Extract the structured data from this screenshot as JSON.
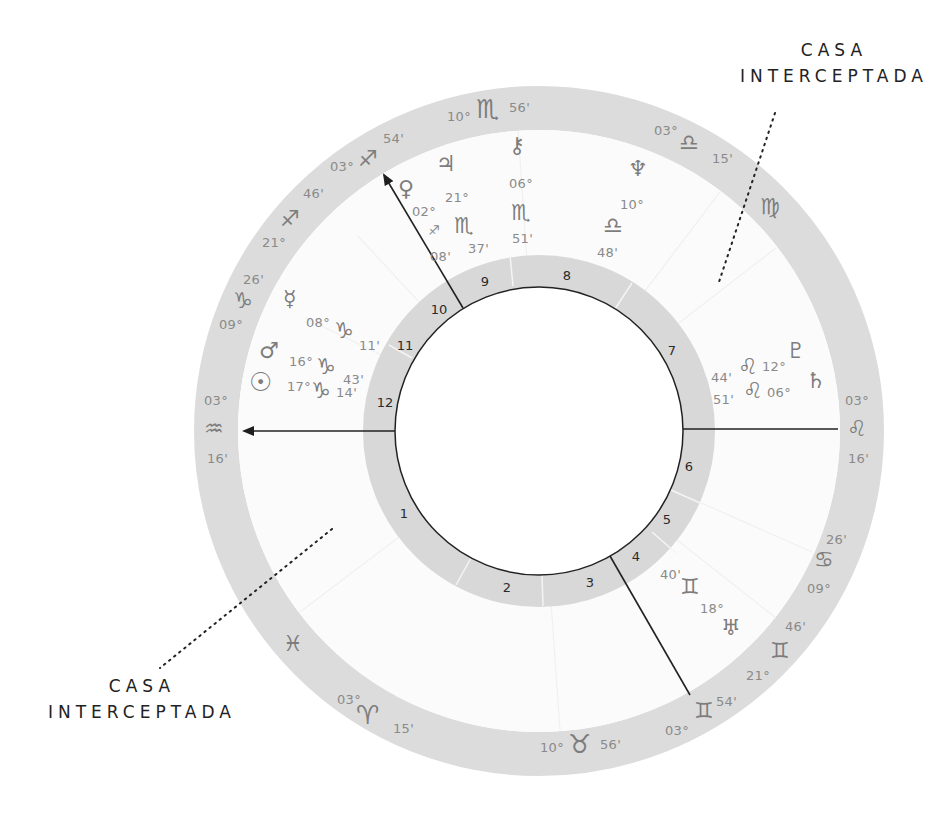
{
  "annotations": {
    "top_right": {
      "line1": "CASA",
      "line2": "INTERCEPTADA"
    },
    "bottom_left": {
      "line1": "CASA",
      "line2": "INTERCEPTADA"
    }
  },
  "houses": [
    "1",
    "2",
    "3",
    "4",
    "5",
    "6",
    "7",
    "8",
    "9",
    "10",
    "11",
    "12"
  ],
  "cusps": {
    "asc": {
      "deg": "03°",
      "sign": "♒",
      "sign_name": "aquarius",
      "min": "16'"
    },
    "desc": {
      "deg": "03°",
      "sign": "♌",
      "sign_name": "leo",
      "min": "16'"
    },
    "mc": {
      "deg": "03°",
      "sign": "♐",
      "sign_name": "sagittarius",
      "min": "54'"
    },
    "ic": {
      "deg": "03°",
      "sign": "♊",
      "sign_name": "gemini",
      "min": "54'"
    },
    "h11": {
      "deg": "21°",
      "sign": "♐",
      "sign_name": "sagittarius",
      "min": "46'"
    },
    "h12": {
      "deg": "09°",
      "sign": "♑",
      "sign_name": "capricorn",
      "min": "26'"
    },
    "h9": {
      "deg": "10°",
      "sign": "♏",
      "sign_name": "scorpio",
      "min": "56'"
    },
    "h8": {
      "deg": "03°",
      "sign": "♎",
      "sign_name": "libra",
      "min": "15'"
    },
    "h5": {
      "deg": "21°",
      "sign": "♊",
      "sign_name": "gemini",
      "min": "46'"
    },
    "h6": {
      "deg": "09°",
      "sign": "♋",
      "sign_name": "cancer",
      "min": "26'"
    },
    "h3": {
      "deg": "10°",
      "sign": "♉",
      "sign_name": "taurus",
      "min": "56'"
    },
    "h2": {
      "deg": "03°",
      "sign": "♈",
      "sign_name": "aries",
      "min": "15'"
    }
  },
  "intercepted_signs": {
    "virgo": "♍",
    "pisces": "♓"
  },
  "planets": [
    {
      "name": "venus",
      "glyph": "♀",
      "deg": "02°",
      "sign": "♐",
      "min": "08'"
    },
    {
      "name": "jupiter",
      "glyph": "♃",
      "deg": "21°",
      "sign": "♏",
      "min": "37'"
    },
    {
      "name": "chiron",
      "glyph": "⚷",
      "deg": "06°",
      "sign": "♏",
      "min": "51'"
    },
    {
      "name": "neptune",
      "glyph": "♆",
      "deg": "10°",
      "sign": "♎",
      "min": "48'"
    },
    {
      "name": "mercury",
      "glyph": "☿",
      "deg": "08°",
      "sign": "♑",
      "min": "11'"
    },
    {
      "name": "mars",
      "glyph": "♂",
      "deg": "16°",
      "sign": "♑",
      "min": "43'"
    },
    {
      "name": "sun",
      "glyph": "☉",
      "deg": "17°",
      "sign": "♑",
      "min": "14'"
    },
    {
      "name": "pluto",
      "glyph": "♇",
      "deg": "12°",
      "sign": "♌",
      "min": "44'"
    },
    {
      "name": "saturn",
      "glyph": "♄",
      "deg": "06°",
      "sign": "♌",
      "min": "51'"
    },
    {
      "name": "uranus",
      "glyph": "♅",
      "deg": "18°",
      "sign": "♊",
      "min": "40'"
    }
  ],
  "colors": {
    "ring_gray": "#dcdcdc",
    "glyph_gray": "#7d7d7d",
    "line": "#222222"
  }
}
